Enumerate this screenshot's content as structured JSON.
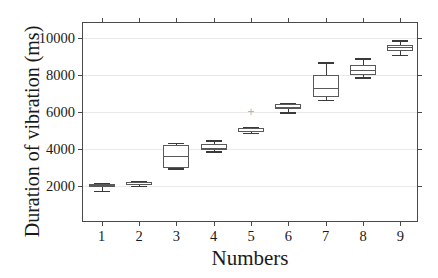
{
  "chart_data": {
    "type": "box",
    "title": "",
    "xlabel": "Numbers",
    "ylabel": "Duration of vibration (ms)",
    "xlim": [
      0.5,
      9.5
    ],
    "ylim": [
      0,
      10800
    ],
    "grid": true,
    "legend": "none",
    "ytick_labels": [
      "2000",
      "4000",
      "6000",
      "8000",
      "10000"
    ],
    "ytick_values": [
      2000,
      4000,
      6000,
      8000,
      10000
    ],
    "xtick_labels": [
      "1",
      "2",
      "3",
      "4",
      "5",
      "6",
      "7",
      "8",
      "9"
    ],
    "categories": [
      "1",
      "2",
      "3",
      "4",
      "5",
      "6",
      "7",
      "8",
      "9"
    ],
    "boxes": [
      {
        "category": "1",
        "whisker_low": 1750,
        "q1": 1930,
        "median": 2030,
        "q3": 2130,
        "whisker_high": 2180,
        "outliers": []
      },
      {
        "category": "2",
        "whisker_low": 2020,
        "q1": 2060,
        "median": 2100,
        "q3": 2200,
        "whisker_high": 2250,
        "outliers": []
      },
      {
        "category": "3",
        "whisker_low": 2950,
        "q1": 2980,
        "median": 3620,
        "q3": 4220,
        "whisker_high": 4330,
        "outliers": []
      },
      {
        "category": "4",
        "whisker_low": 3880,
        "q1": 3950,
        "median": 4060,
        "q3": 4280,
        "whisker_high": 4480,
        "outliers": []
      },
      {
        "category": "5",
        "whisker_low": 4880,
        "q1": 4920,
        "median": 4990,
        "q3": 5130,
        "whisker_high": 5160,
        "outliers": [
          6000
        ]
      },
      {
        "category": "6",
        "whisker_low": 5980,
        "q1": 6130,
        "median": 6250,
        "q3": 6430,
        "whisker_high": 6500,
        "outliers": []
      },
      {
        "category": "7",
        "whisker_low": 6650,
        "q1": 6780,
        "median": 7300,
        "q3": 7980,
        "whisker_high": 8680,
        "outliers": []
      },
      {
        "category": "8",
        "whisker_low": 7880,
        "q1": 7980,
        "median": 8280,
        "q3": 8550,
        "whisker_high": 8900,
        "outliers": []
      },
      {
        "category": "9",
        "whisker_low": 9080,
        "q1": 9280,
        "median": 9480,
        "q3": 9620,
        "whisker_high": 9880,
        "outliers": []
      }
    ],
    "colors": {
      "box_edge": "#595959",
      "median": "#595959",
      "whisker": "#3a3a3a",
      "outlier": "#b4b4b4",
      "grid": "#e9e9e9",
      "axis": "#4a4a4a",
      "background": "#ffffff"
    }
  }
}
